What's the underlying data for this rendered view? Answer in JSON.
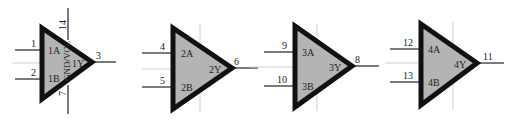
{
  "diagram": {
    "type": "logic-gate-schematic",
    "colors": {
      "gate_fill": "#b4b4b4",
      "gate_stroke": "#111111",
      "wire": "#222222",
      "guide": "#cfcfcf"
    },
    "gates": [
      {
        "id": "gate1",
        "inputs": [
          {
            "pin": "1",
            "name": "1A"
          },
          {
            "pin": "2",
            "name": "1B"
          }
        ],
        "output": {
          "pin": "3",
          "name": "1Y"
        },
        "power": {
          "top_pin": "14",
          "bottom_pin": "7",
          "label": "GND/VCC"
        }
      },
      {
        "id": "gate2",
        "inputs": [
          {
            "pin": "4",
            "name": "2A"
          },
          {
            "pin": "5",
            "name": "2B"
          }
        ],
        "output": {
          "pin": "6",
          "name": "2Y"
        }
      },
      {
        "id": "gate3",
        "inputs": [
          {
            "pin": "9",
            "name": "3A"
          },
          {
            "pin": "10",
            "name": "3B"
          }
        ],
        "output": {
          "pin": "8",
          "name": "3Y"
        }
      },
      {
        "id": "gate4",
        "inputs": [
          {
            "pin": "12",
            "name": "4A"
          },
          {
            "pin": "13",
            "name": "4B"
          }
        ],
        "output": {
          "pin": "11",
          "name": "4Y"
        }
      }
    ]
  }
}
